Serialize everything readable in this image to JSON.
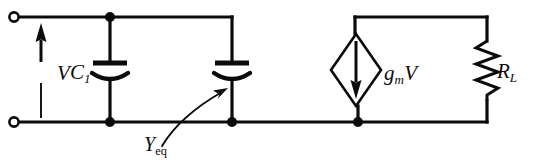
{
  "figure": {
    "name": "small-signal-equivalent-circuit",
    "type": "electrical-schematic",
    "background_color": "#ffffff",
    "ink_color": "#0b0b0b"
  },
  "labels": {
    "input_voltage": "V",
    "capacitor_1": "C",
    "capacitor_1_subscript": "1",
    "equivalent_admittance": "Y",
    "equivalent_admittance_subscript": "eq",
    "dependent_source_g": "g",
    "dependent_source_g_subscript": "m",
    "dependent_source_v": "V",
    "load_resistor": "R",
    "load_resistor_subscript": "L"
  },
  "components": [
    {
      "id": "input-terminal-top",
      "kind": "terminal",
      "symbol": "open-circle",
      "x": 14,
      "y": 17
    },
    {
      "id": "input-terminal-bottom",
      "kind": "terminal",
      "symbol": "open-circle",
      "x": 14,
      "y": 122
    },
    {
      "id": "voltage-arrow-v",
      "kind": "voltage-reference-arrow",
      "direction": "up",
      "label": "V",
      "x": 41,
      "y_tip": 26,
      "y_tail": 118
    },
    {
      "id": "capacitor-c1",
      "kind": "capacitor",
      "style": "curved-plate",
      "label": "C1",
      "x": 110,
      "y": 70
    },
    {
      "id": "capacitor-yeq",
      "kind": "capacitor",
      "style": "curved-plate",
      "label": "Yeq",
      "x": 232,
      "y": 70
    },
    {
      "id": "dependent-current-source",
      "kind": "dependent-current-source",
      "symbol": "diamond",
      "arrow_direction": "down",
      "label": "gmV",
      "x": 358,
      "y": 70
    },
    {
      "id": "load-resistor",
      "kind": "resistor",
      "symbol": "zigzag",
      "label": "RL",
      "x": 487,
      "y": 70
    }
  ],
  "nodes": [
    {
      "id": "node-top-c1",
      "x": 110,
      "y": 17,
      "filled": true
    },
    {
      "id": "node-bot-c1",
      "x": 110,
      "y": 122,
      "filled": true
    },
    {
      "id": "node-bot-yeq",
      "x": 232,
      "y": 122,
      "filled": true
    },
    {
      "id": "node-bot-src",
      "x": 358,
      "y": 122,
      "filled": true
    }
  ],
  "annotations": [
    {
      "id": "yeq-pointer",
      "kind": "curved-arrow",
      "from_label": "Yeq",
      "points_to": "capacitor-yeq"
    }
  ]
}
